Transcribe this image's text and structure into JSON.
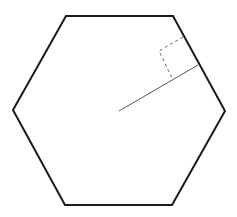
{
  "diagram": {
    "type": "geometry",
    "shape": "regular-hexagon",
    "background": "#ffffff",
    "hexagon": {
      "stroke": "#1a1a1a",
      "stroke_width": 2,
      "vertices": [
        [
          66,
          16
        ],
        [
          173,
          16
        ],
        [
          225,
          111
        ],
        [
          172,
          205
        ],
        [
          65,
          205
        ],
        [
          13,
          110
        ]
      ]
    },
    "apothem": {
      "stroke": "#555555",
      "stroke_width": 1,
      "from": [
        119,
        111
      ],
      "to": [
        198,
        65
      ]
    },
    "right_angle_marker": {
      "stroke": "#666666",
      "stroke_width": 1,
      "dash": "3,3",
      "points": [
        [
          183,
          37
        ],
        [
          159,
          51
        ],
        [
          172,
          78
        ]
      ]
    }
  }
}
